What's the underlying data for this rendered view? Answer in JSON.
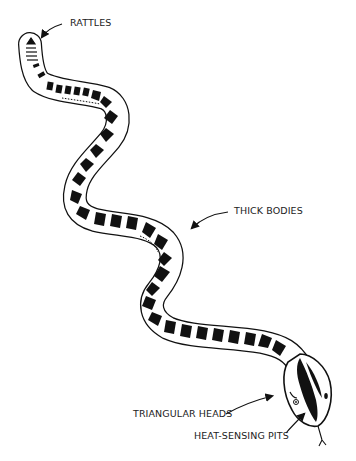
{
  "figure": {
    "labels": [
      {
        "id": "rattles",
        "text": "RATTLES"
      },
      {
        "id": "thick_bodies",
        "text": "THICK BODIES"
      },
      {
        "id": "triangular_heads",
        "text": "TRIANGULAR HEADS"
      },
      {
        "id": "heat_sensing_pits",
        "text": "HEAT-SENSING PITS"
      }
    ]
  },
  "colors": {
    "ink": "#111111",
    "background": "#ffffff"
  }
}
